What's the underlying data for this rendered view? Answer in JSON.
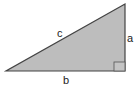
{
  "diagram": {
    "type": "right-triangle",
    "fill_color": "#bdbdbd",
    "stroke_color": "#444444",
    "vertices": {
      "bottom_left": [
        6,
        71
      ],
      "bottom_right": [
        125,
        71
      ],
      "top_right": [
        125,
        4
      ]
    },
    "labels": {
      "hypotenuse": "c",
      "vertical_leg": "a",
      "horizontal_leg": "b"
    },
    "right_angle_marker": true
  }
}
